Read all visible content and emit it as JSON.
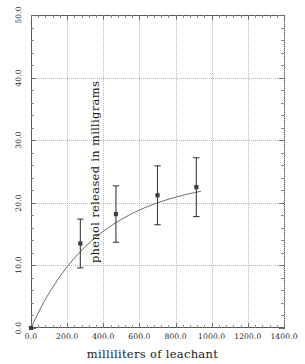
{
  "chart_data": {
    "type": "line",
    "title": "",
    "subtitle": "",
    "xlabel": "milliliters of leachant",
    "ylabel": "phenol released in milligrams",
    "xlim": [
      0,
      1400
    ],
    "ylim": [
      0,
      50
    ],
    "xticks": [
      0,
      200,
      400,
      600,
      800,
      1000,
      1200,
      1400
    ],
    "yticks": [
      0,
      10,
      20,
      30,
      40,
      50
    ],
    "xticklabels": [
      "0.0",
      "200.0",
      "400.0",
      "600.0",
      "800.0",
      "1000.0",
      "1200.0",
      "1400.0"
    ],
    "yticklabels": [
      "0.0",
      "10.0",
      "20.0",
      "30.0",
      "40.0",
      "50.0"
    ],
    "grid": true,
    "grid_style": "dotted",
    "legend": "none",
    "minor_ticks": true,
    "series": [
      {
        "name": "phenol released",
        "kind": "errorbar",
        "marker": "square",
        "x": [
          273,
          470,
          700,
          915
        ],
        "y": [
          13.5,
          18.2,
          21.2,
          22.5
        ],
        "yerr": [
          3.9,
          4.5,
          4.7,
          4.7
        ],
        "y_lower": [
          9.6,
          13.7,
          16.5,
          17.8
        ],
        "y_upper": [
          17.4,
          22.7,
          25.9,
          27.2
        ]
      },
      {
        "name": "fitted saturation curve",
        "kind": "line",
        "anchor": [
          0,
          0
        ],
        "x": [
          0,
          25,
          50,
          75,
          100,
          150,
          200,
          250,
          300,
          350,
          400,
          450,
          500,
          550,
          600,
          650,
          700,
          750,
          800,
          850,
          900,
          940
        ],
        "y": [
          0,
          1.55,
          2.99,
          4.33,
          5.58,
          7.83,
          9.79,
          11.5,
          13.0,
          14.3,
          15.45,
          16.47,
          17.36,
          18.15,
          18.85,
          19.46,
          20.0,
          20.48,
          20.9,
          21.28,
          21.6,
          21.84
        ]
      }
    ]
  },
  "axes": {
    "colors": {
      "frame": "#5a5a5a",
      "grid": "#b9b9b9",
      "data": "#3d3d3d",
      "curve": "#6d6d6d",
      "text": "#1d1d1d"
    }
  }
}
